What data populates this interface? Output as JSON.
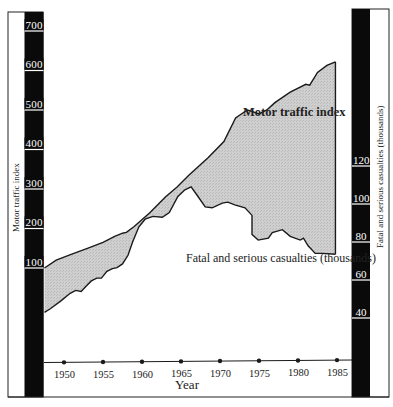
{
  "chart_data": {
    "type": "area",
    "title": "",
    "xlabel": "Year",
    "x_ticks": [
      1950,
      1955,
      1960,
      1965,
      1970,
      1975,
      1980,
      1985
    ],
    "xlim": [
      1947.5,
      1985
    ],
    "left_axis": {
      "label": "Motor traffic index",
      "ticks": [
        100,
        200,
        300,
        400,
        500,
        600,
        700
      ],
      "ylim": [
        100,
        700
      ]
    },
    "right_axis": {
      "label": "Fatal and serious casualties (thousands)",
      "ticks": [
        40,
        60,
        80,
        100,
        120
      ],
      "ylim": [
        40,
        120
      ]
    },
    "series": [
      {
        "name": "Motor traffic index",
        "axis": "left",
        "x": [
          1947.5,
          1949,
          1951,
          1953,
          1955,
          1956.5,
          1957.5,
          1958,
          1959,
          1961,
          1963,
          1964.5,
          1966,
          1968.5,
          1970.5,
          1972,
          1973.5,
          1974,
          1975,
          1976,
          1977,
          1977.5,
          1979,
          1981,
          1981.5,
          1982.5,
          1983.7,
          1984.8
        ],
        "values": [
          100,
          120,
          135,
          150,
          165,
          180,
          188,
          190,
          205,
          240,
          280,
          305,
          335,
          380,
          420,
          480,
          500,
          497,
          490,
          500,
          518,
          525,
          545,
          565,
          563,
          595,
          613,
          622
        ]
      },
      {
        "name": "Fatal and serious casualties (thousands)",
        "axis": "right",
        "x": [
          1947.5,
          1948.3,
          1949.6,
          1950.8,
          1951.5,
          1952.2,
          1952.8,
          1953.5,
          1954.2,
          1954.8,
          1955.5,
          1956.2,
          1956.8,
          1957.5,
          1958.2,
          1958.8,
          1959.6,
          1960.4,
          1961.4,
          1962.6,
          1963.5,
          1964.6,
          1965.5,
          1966.3,
          1967,
          1968.1,
          1969,
          1970.3,
          1971,
          1971.9,
          1973.2,
          1974.1,
          1974.1,
          1974.9,
          1976.2,
          1976.7,
          1978,
          1979,
          1980.3,
          1980.7,
          1981.3,
          1982.2,
          1983.1,
          1984.8
        ],
        "values": [
          43,
          45,
          49,
          53,
          54.5,
          54,
          56.5,
          59.5,
          61,
          61,
          64.5,
          66,
          66.5,
          68.5,
          73,
          80,
          88,
          92,
          93.5,
          93,
          95.5,
          104,
          107.5,
          109,
          105,
          98.5,
          98,
          100.5,
          101,
          99.5,
          98,
          94,
          84,
          81,
          82,
          85,
          86.5,
          83,
          81,
          82,
          78,
          74,
          74,
          73.5
        ]
      }
    ],
    "annotations": [
      {
        "text": "Motor traffic index",
        "position": "inside shaded band, upper right"
      },
      {
        "text": "Fatal and serious casualties (thousands)",
        "position": "below shaded band, right"
      }
    ],
    "grid": false,
    "fill_between_series": true,
    "legend": "none (inline labels)"
  },
  "labels": {
    "left_axis_title": "Motor traffic index",
    "right_axis_title": "Fatal and serious casualties (thousands)",
    "x_axis_title": "Year",
    "series_upper_label": "Motor traffic index",
    "series_lower_label": "Fatal and serious casualties (thousands)",
    "left_ticks": [
      "700",
      "600",
      "500",
      "400",
      "300",
      "200",
      "100"
    ],
    "right_ticks": [
      "120",
      "100",
      "80",
      "60",
      "40"
    ],
    "year_ticks": [
      "1950",
      "1955",
      "1960",
      "1965",
      "1970",
      "1975",
      "1980",
      "1985"
    ]
  },
  "colors": {
    "band_fill": "#c9c9c9",
    "axis_bar": "#0a0a0a",
    "line": "#1a1a1a"
  }
}
